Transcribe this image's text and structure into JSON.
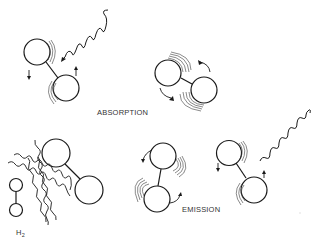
{
  "diagram": {
    "labels": {
      "absorption": "ABSORPTION",
      "emission": "EMISSION",
      "h2_main": "H",
      "h2_sub": "2"
    },
    "colors": {
      "ink": "#1a1a1a",
      "text": "#333333",
      "background": "#ffffff"
    },
    "panels": [
      {
        "id": "absorption-photon-incoming",
        "description": "diatomic molecule with incoming photon wave, rotation arrows"
      },
      {
        "id": "absorption-rotating",
        "description": "diatomic molecule rotating after absorption"
      },
      {
        "id": "collision",
        "description": "H2 molecule and thermal radiation wavy lines striking diatomic molecule"
      },
      {
        "id": "emission-rotating",
        "description": "diatomic molecule rotating before emission"
      },
      {
        "id": "emission-photon-outgoing",
        "description": "diatomic molecule emitting photon wave"
      }
    ]
  }
}
